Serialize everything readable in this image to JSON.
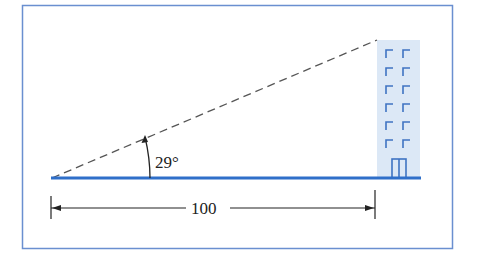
{
  "diagram": {
    "type": "right-triangle-elevation",
    "angle_label": "29°",
    "angle_degrees": 29,
    "distance_label": "100",
    "distance_value": 100,
    "colors": {
      "frame": "#6a8fd0",
      "ground": "#2f6fc9",
      "building_fill": "#dce8f6",
      "building_lines": "#3f73c2",
      "dashed_line": "#555555",
      "dimension_line": "#222222"
    }
  }
}
